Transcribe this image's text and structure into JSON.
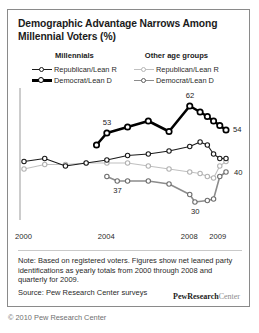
{
  "title": "Demographic Advantage Narrows Among Millennial Voters (%)",
  "legend": {
    "groups": [
      {
        "heading": "Millennials",
        "entries": [
          {
            "label": "Republican/Lean R",
            "color": "#1b1b1b",
            "width": 1.1
          },
          {
            "label": "Democrat/Lean D",
            "color": "#000000",
            "width": 2.6
          }
        ]
      },
      {
        "heading": "Other age groups",
        "entries": [
          {
            "label": "Republican/Lean R",
            "color": "#c0c0c0",
            "width": 1.1
          },
          {
            "label": "Democrat/Lean D",
            "color": "#8c8c8c",
            "width": 1.6
          }
        ]
      }
    ]
  },
  "note": "Note: Based on registered voters. Figures show net leaned party identifications as yearly totals from 2000 through 2008 and quarterly for 2009.",
  "source": "Source: Pew Research Center surveys",
  "logo": {
    "bold": "PewResearch",
    "light": "Center"
  },
  "copyright": "© 2010 Pew Research Center",
  "chart_data": {
    "type": "line",
    "title": "Demographic Advantage Narrows Among Millennial Voters (%)",
    "xlabel": "",
    "ylabel": "",
    "grid": false,
    "legend_position": "top",
    "xlim": [
      2000,
      2009.75
    ],
    "ylim": [
      26,
      64
    ],
    "xticks": [
      "2000",
      "2004",
      "2008",
      "2009"
    ],
    "xtick_values": [
      2000,
      2004,
      2008,
      2009.375
    ],
    "annotations": [
      {
        "text": "53",
        "x": 2004,
        "y": 53,
        "series": "Millennials Democrat/Lean D"
      },
      {
        "text": "62",
        "x": 2008,
        "y": 62,
        "series": "Millennials Democrat/Lean D"
      },
      {
        "text": "54",
        "x": 2009.75,
        "y": 54,
        "series": "Millennials Democrat/Lean D"
      },
      {
        "text": "37",
        "x": 2004.5,
        "y": 37,
        "series": "Other age groups Democrat/Lean D"
      },
      {
        "text": "30",
        "x": 2008.25,
        "y": 30,
        "series": "Other age groups Democrat/Lean D"
      },
      {
        "text": "40",
        "x": 2009.75,
        "y": 40,
        "series": "Other age groups Democrat/Lean D"
      }
    ],
    "series": [
      {
        "name": "Millennials Democrat/Lean D",
        "color": "#000000",
        "width": 2.6,
        "x": [
          2003.5,
          2004,
          2005,
          2006,
          2007,
          2008,
          2008.5,
          2008.85,
          2009.15,
          2009.45,
          2009.75
        ],
        "values": [
          49,
          53,
          55,
          57,
          53.5,
          62,
          60,
          58.5,
          57,
          55.5,
          54
        ]
      },
      {
        "name": "Millennials Republican/Lean R",
        "color": "#1b1b1b",
        "width": 1.1,
        "x": [
          2000,
          2001,
          2002,
          2003,
          2004,
          2005,
          2006,
          2007,
          2008,
          2008.5,
          2008.85,
          2009.15,
          2009.45,
          2009.75
        ],
        "values": [
          43.5,
          44.5,
          42,
          43,
          44,
          45.5,
          46,
          47,
          48.5,
          50,
          49,
          46,
          44.5,
          44.5
        ]
      },
      {
        "name": "Other age groups Republican/Lean R",
        "color": "#c0c0c0",
        "width": 1.1,
        "x": [
          2000,
          2001,
          2002,
          2003,
          2004,
          2005,
          2006,
          2007,
          2008,
          2008.5,
          2008.85,
          2009.15,
          2009.45,
          2009.75
        ],
        "values": [
          41,
          42.5,
          42.5,
          43,
          43,
          43,
          42,
          41,
          40,
          39.5,
          38.5,
          38,
          42,
          43.5
        ]
      },
      {
        "name": "Other age groups Democrat/Lean D",
        "color": "#8c8c8c",
        "width": 1.6,
        "x": [
          2004,
          2004.5,
          2005,
          2006,
          2007,
          2008,
          2008.25,
          2008.85,
          2009.15,
          2009.45,
          2009.75
        ],
        "values": [
          38.5,
          37,
          37,
          37,
          36,
          32.5,
          30,
          30.5,
          31,
          38.5,
          40
        ]
      }
    ]
  }
}
